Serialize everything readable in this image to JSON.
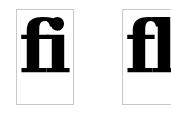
{
  "figures": [
    {
      "label": "fi",
      "description": "fi ligature"
    },
    {
      "label": "fl",
      "description": "fl ligature"
    }
  ],
  "colors": {
    "glyph": "#000000",
    "border": "#c8c8c8",
    "background": "#ffffff"
  }
}
